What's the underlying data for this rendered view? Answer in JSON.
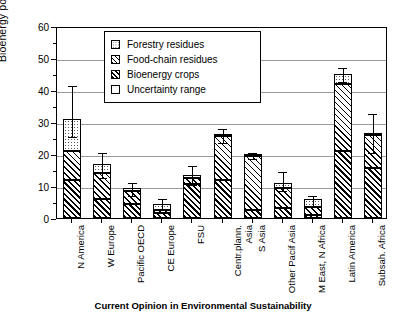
{
  "chart_data": {
    "type": "bar",
    "title": "",
    "xlabel": "",
    "ylabel": "Bioenergy potential [EJ/yr]",
    "ylim": [
      0,
      60
    ],
    "yticks": [
      0,
      10,
      20,
      30,
      40,
      50,
      60
    ],
    "grid": true,
    "stacked": true,
    "legend_position": "top-center",
    "categories": [
      "N America",
      "W Europe",
      "Pacific OECD",
      "CE Europe",
      "FSU",
      "Centr.plann. Asia",
      "S Asia",
      "Other Pacif Asia",
      "M East, N Africa",
      "Latin America",
      "Subsah. Africa"
    ],
    "series": [
      {
        "name": "Bioenergy crops",
        "values": [
          12.0,
          6.0,
          4.5,
          1.5,
          10.5,
          12.0,
          2.5,
          3.0,
          0.8,
          21.0,
          15.5
        ]
      },
      {
        "name": "Food-chain residues",
        "values": [
          9.0,
          8.0,
          4.0,
          1.0,
          2.0,
          13.5,
          17.0,
          6.5,
          2.5,
          21.0,
          10.5
        ]
      },
      {
        "name": "Forestry residues",
        "values": [
          10.0,
          3.0,
          0.8,
          2.0,
          1.0,
          0.8,
          0.5,
          1.5,
          2.5,
          3.0,
          0.5
        ]
      }
    ],
    "totals": [
      31.0,
      17.0,
      9.3,
      4.5,
      13.5,
      26.3,
      20.0,
      11.0,
      5.8,
      45.0,
      26.5
    ],
    "uncertainty": [
      {
        "category": "N America",
        "low": 26.0,
        "high": 42.0
      },
      {
        "category": "W Europe",
        "low": 13.0,
        "high": 21.0
      },
      {
        "category": "Pacific OECD",
        "low": 7.5,
        "high": 11.5
      },
      {
        "category": "CE Europe",
        "low": 3.0,
        "high": 6.5
      },
      {
        "category": "FSU",
        "low": 11.0,
        "high": 17.0
      },
      {
        "category": "Centr.plann. Asia",
        "low": 24.0,
        "high": 28.5
      },
      {
        "category": "S Asia",
        "low": 19.0,
        "high": 21.0
      },
      {
        "category": "Other Pacif Asia",
        "low": 9.0,
        "high": 15.0
      },
      {
        "category": "M East, N Africa",
        "low": 4.5,
        "high": 7.5
      },
      {
        "category": "Latin America",
        "low": 43.0,
        "high": 47.5
      },
      {
        "category": "Subsah. Africa",
        "low": 21.0,
        "high": 33.0
      }
    ]
  },
  "legend": {
    "items": [
      {
        "label": "Forestry residues",
        "pattern": "dotted"
      },
      {
        "label": "Food-chain residues",
        "pattern": "diagonal-hatch"
      },
      {
        "label": "Bioenergy crops",
        "pattern": "dense-diagonal-hatch"
      },
      {
        "label": "Uncertainty range",
        "pattern": "empty"
      }
    ]
  },
  "axes": {
    "y_title": "Bioenergy potential [EJ/yr]",
    "y_ticks": [
      "0",
      "10",
      "20",
      "30",
      "40",
      "50",
      "60"
    ],
    "x_labels": [
      "N America",
      "W Europe",
      "Pacific OECD",
      "CE Europe",
      "FSU",
      "Centr.plann.\nAsia",
      "S Asia",
      "Other Pacif Asia",
      "M East, N Africa",
      "Latin America",
      "Subsah. Africa"
    ]
  },
  "caption": "Current Opinion in Environmental Sustainability",
  "colors": {
    "axis": "#000000",
    "grid": "#9a9a9a",
    "background": "#ffffff",
    "hatch": "#000000",
    "dots": "#5a5a5a"
  }
}
